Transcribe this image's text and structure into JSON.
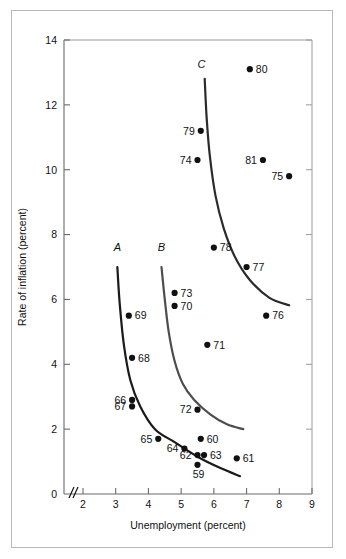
{
  "chart_data": {
    "type": "scatter",
    "title": "",
    "xlabel": "Unemployment (percent)",
    "ylabel": "Rate of inflation (percent)",
    "xlim": [
      1.6,
      9.0
    ],
    "ylim": [
      0,
      14
    ],
    "xticks": [
      "2",
      "3",
      "4",
      "5",
      "6",
      "7",
      "8",
      "9"
    ],
    "xtick_values": [
      2,
      3,
      4,
      5,
      6,
      7,
      8,
      9
    ],
    "yticks": [
      "0",
      "2",
      "4",
      "6",
      "8",
      "10",
      "12",
      "14"
    ],
    "ytick_values": [
      0,
      2,
      4,
      6,
      8,
      10,
      12,
      14
    ],
    "grid": false,
    "legend": "none",
    "axis_break": "//",
    "points": [
      {
        "label": "59",
        "x": 5.5,
        "y": 0.9
      },
      {
        "label": "60",
        "x": 5.6,
        "y": 1.7
      },
      {
        "label": "61",
        "x": 6.7,
        "y": 1.1
      },
      {
        "label": "62",
        "x": 5.5,
        "y": 1.2
      },
      {
        "label": "63",
        "x": 5.7,
        "y": 1.2
      },
      {
        "label": "64",
        "x": 5.1,
        "y": 1.4
      },
      {
        "label": "65",
        "x": 4.3,
        "y": 1.7
      },
      {
        "label": "66",
        "x": 3.5,
        "y": 2.9
      },
      {
        "label": "67",
        "x": 3.5,
        "y": 2.7
      },
      {
        "label": "68",
        "x": 3.5,
        "y": 4.2
      },
      {
        "label": "69",
        "x": 3.4,
        "y": 5.5
      },
      {
        "label": "70",
        "x": 4.8,
        "y": 5.8
      },
      {
        "label": "71",
        "x": 5.8,
        "y": 4.6
      },
      {
        "label": "72",
        "x": 5.5,
        "y": 2.6
      },
      {
        "label": "73",
        "x": 4.8,
        "y": 6.2
      },
      {
        "label": "74",
        "x": 5.5,
        "y": 10.3
      },
      {
        "label": "75",
        "x": 8.3,
        "y": 9.8
      },
      {
        "label": "76",
        "x": 7.6,
        "y": 5.5
      },
      {
        "label": "77",
        "x": 7.0,
        "y": 7.0
      },
      {
        "label": "78",
        "x": 6.0,
        "y": 7.6
      },
      {
        "label": "79",
        "x": 5.6,
        "y": 11.2
      },
      {
        "label": "80",
        "x": 7.1,
        "y": 13.1
      },
      {
        "label": "81",
        "x": 7.5,
        "y": 10.3
      }
    ],
    "curves": [
      {
        "name": "A",
        "label": "A",
        "color": "#1a1a1a",
        "points": [
          [
            3.05,
            7.0
          ],
          [
            3.12,
            5.9
          ],
          [
            3.25,
            4.6
          ],
          [
            3.45,
            3.5
          ],
          [
            3.75,
            2.7
          ],
          [
            4.2,
            2.0
          ],
          [
            4.8,
            1.6
          ],
          [
            5.5,
            1.15
          ],
          [
            6.2,
            0.8
          ],
          [
            6.8,
            0.55
          ]
        ]
      },
      {
        "name": "B",
        "label": "B",
        "color": "#4d4d4d",
        "points": [
          [
            4.4,
            7.0
          ],
          [
            4.5,
            6.0
          ],
          [
            4.62,
            5.0
          ],
          [
            4.8,
            4.1
          ],
          [
            5.05,
            3.4
          ],
          [
            5.4,
            2.9
          ],
          [
            5.9,
            2.45
          ],
          [
            6.4,
            2.15
          ],
          [
            6.9,
            2.0
          ]
        ]
      },
      {
        "name": "C",
        "label": "C",
        "color": "#2b2b2b",
        "points": [
          [
            5.72,
            12.8
          ],
          [
            5.78,
            11.6
          ],
          [
            5.88,
            10.4
          ],
          [
            6.05,
            9.2
          ],
          [
            6.3,
            8.2
          ],
          [
            6.65,
            7.3
          ],
          [
            7.1,
            6.6
          ],
          [
            7.7,
            6.05
          ],
          [
            8.3,
            5.82
          ]
        ]
      }
    ],
    "curve_labels": [
      {
        "text": "A",
        "x": 3.05,
        "y": 7.5
      },
      {
        "text": "B",
        "x": 4.4,
        "y": 7.5
      },
      {
        "text": "C",
        "x": 5.62,
        "y": 13.15
      }
    ]
  }
}
